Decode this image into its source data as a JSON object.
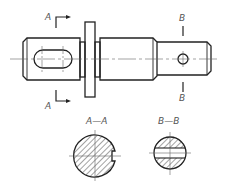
{
  "drawing": {
    "type": "engineering-shaft-drawing",
    "colors": {
      "line": "#222222",
      "centerline": "#666666",
      "label": "#555555",
      "background": "#ffffff"
    },
    "section_a": {
      "marker_top": "A",
      "marker_bottom": "A",
      "title": "A—A"
    },
    "section_b": {
      "marker_top": "B",
      "marker_bottom": "B",
      "title": "B—B"
    }
  }
}
